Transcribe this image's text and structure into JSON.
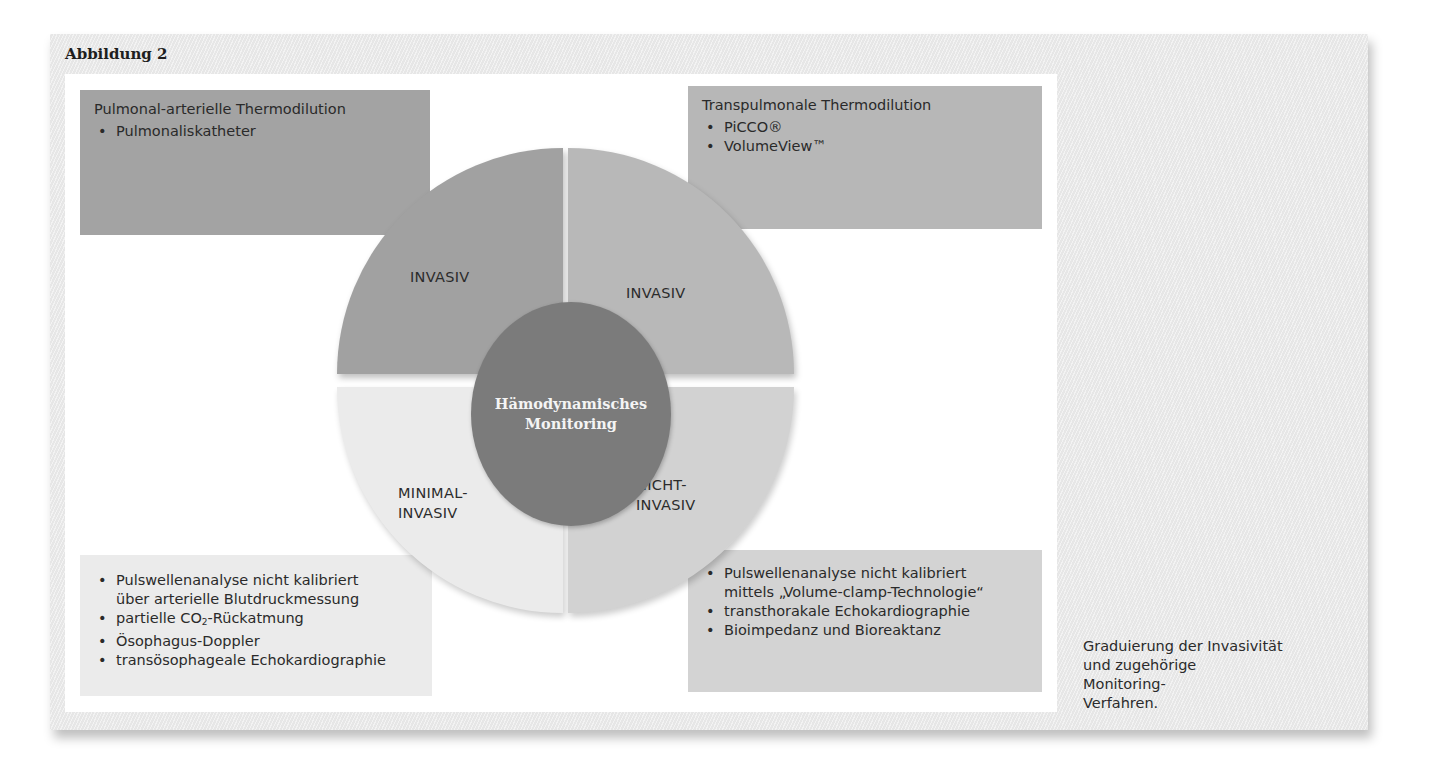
{
  "figure": {
    "title": "Abbildung 2",
    "caption_lines": [
      "Graduierung der Invasivität",
      "und zugehörige Monitoring-",
      "Verfahren."
    ]
  },
  "center": {
    "lines": [
      "Hämodynamisches",
      "Monitoring"
    ],
    "color": "#7b7b7b"
  },
  "quadrants": [
    {
      "position": "top-left",
      "label_lines": [
        "INVASIV"
      ],
      "color": "#a1a1a1"
    },
    {
      "position": "top-right",
      "label_lines": [
        "INVASIV"
      ],
      "color": "#b8b8b8"
    },
    {
      "position": "bottom-left",
      "label_lines": [
        "MINIMAL-",
        "INVASIV"
      ],
      "color": "#ebebeb"
    },
    {
      "position": "bottom-right",
      "label_lines": [
        "NICHT-",
        "INVASIV"
      ],
      "color": "#d2d2d2"
    }
  ],
  "boxes": {
    "top_left": {
      "heading": "Pulmonal-arterielle Thermodilution",
      "items": [
        "Pulmonaliskatheter"
      ]
    },
    "top_right": {
      "heading": "Transpulmonale Thermodilution",
      "items": [
        "PiCCO®",
        "VolumeView™"
      ]
    },
    "bottom_left": {
      "items": [
        {
          "line1": "Pulswellenanalyse nicht kalibriert",
          "line2": "über arterielle Blutdruckmessung"
        },
        {
          "pre": "partielle CO",
          "sub": "2",
          "post": "-Rückatmung"
        },
        {
          "text": "Ösophagus-Doppler"
        },
        {
          "text": "transösophageale Echokardiographie"
        }
      ]
    },
    "bottom_right": {
      "items": [
        {
          "line1": "Pulswellenanalyse nicht kalibriert",
          "line2": "mittels „Volume-clamp-Technologie“"
        },
        {
          "text": "transthorakale Echokardiographie"
        },
        {
          "text": "Bioimpedanz und Bioreaktanz"
        }
      ]
    }
  }
}
